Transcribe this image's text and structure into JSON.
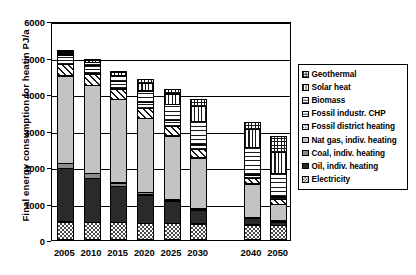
{
  "chart_data": {
    "type": "bar",
    "stacked": true,
    "title": "",
    "xlabel": "",
    "ylabel": "Final energy consumption for heatin PJ/a",
    "ylim": [
      0,
      6000
    ],
    "yticks": [
      0,
      1000,
      2000,
      3000,
      4000,
      5000,
      6000
    ],
    "ytick_labels": [
      "0",
      "1000",
      "2000",
      "3000",
      "4000",
      "5000",
      "6000"
    ],
    "grid": true,
    "legend_position": "right",
    "categories": [
      "2005",
      "2010",
      "2015",
      "2020",
      "2025",
      "2030",
      "2040",
      "2050"
    ],
    "series": [
      {
        "name": "Electricity",
        "values": [
          500,
          490,
          480,
          470,
          460,
          450,
          420,
          400
        ]
      },
      {
        "name": "Oil, indiv. heating",
        "values": [
          1480,
          1230,
          1010,
          790,
          640,
          390,
          190,
          110
        ]
      },
      {
        "name": "Coal, indiv. heating",
        "values": [
          170,
          150,
          120,
          90,
          60,
          40,
          20,
          10
        ]
      },
      {
        "name": "Nat gas, indiv. heating",
        "values": [
          2410,
          2430,
          2300,
          2040,
          1760,
          1420,
          940,
          470
        ]
      },
      {
        "name": "Fossil district heating",
        "values": [
          330,
          330,
          310,
          290,
          270,
          250,
          170,
          160
        ]
      },
      {
        "name": "Fossil industr. CHP",
        "values": [
          280,
          260,
          230,
          200,
          180,
          150,
          110,
          90
        ]
      },
      {
        "name": "Biomass",
        "values": [
          60,
          100,
          170,
          330,
          470,
          660,
          780,
          660
        ]
      },
      {
        "name": "Solar heat",
        "values": [
          60,
          80,
          110,
          220,
          300,
          430,
          510,
          600
        ]
      },
      {
        "name": "Geothermal",
        "values": [
          60,
          50,
          60,
          130,
          150,
          210,
          210,
          460
        ]
      }
    ],
    "totals": [
      5350,
      5120,
      4790,
      4560,
      4290,
      4000,
      3350,
      2960
    ]
  },
  "legend": {
    "items": [
      {
        "label": "Geothermal",
        "pattern": "grid-swatch"
      },
      {
        "label": "Solar heat",
        "pattern": "vertical-lines-swatch"
      },
      {
        "label": "Biomass",
        "pattern": "horizontal-lines-wide-swatch"
      },
      {
        "label": "Fossil industr. CHP",
        "pattern": "horizontal-lines-tight-swatch"
      },
      {
        "label": "Fossil district heating",
        "pattern": "diagonal-hatch-swatch"
      },
      {
        "label": "Nat gas, indiv. heating",
        "pattern": "light-grey-swatch"
      },
      {
        "label": "Coal, indiv. heating",
        "pattern": "medium-grey-swatch"
      },
      {
        "label": "Oil, indiv. heating",
        "pattern": "solid-black-swatch"
      },
      {
        "label": "Electricity",
        "pattern": "checker-swatch"
      }
    ]
  },
  "colors": {
    "axis": "#000000",
    "oil": "#2a2a2a",
    "coal": "#8c8c8c",
    "natgas": "#c3c3c3",
    "background": "#ffffff"
  }
}
